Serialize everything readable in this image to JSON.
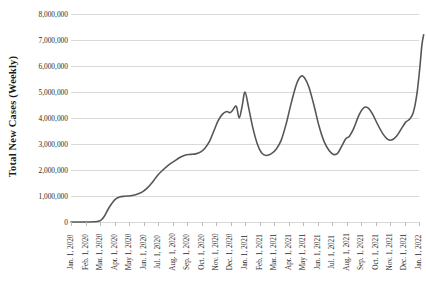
{
  "chart_data": {
    "type": "line",
    "title": "",
    "xlabel": "",
    "ylabel": "Total New Cases (Weekly)",
    "ylim": [
      0,
      8000000
    ],
    "y_ticks": [
      0,
      1000000,
      2000000,
      3000000,
      4000000,
      5000000,
      6000000,
      7000000,
      8000000
    ],
    "y_tick_labels": [
      "0",
      "1,000,000",
      "2,000,000",
      "3,000,000",
      "4,000,000",
      "5,000,000",
      "6,000,000",
      "7,000,000",
      "8,000,000"
    ],
    "grid": "horizontal",
    "legend": "none",
    "line_color": "#575757",
    "categories": [
      "Jan. 1, 2020",
      "Feb. 1, 2020",
      "Mar. 1, 2020",
      "Apr. 1, 2020",
      "May 1, 2020",
      "Jun. 1, 2020",
      "Jul. 1, 2020",
      "Aug. 1, 2020",
      "Sep. 1, 2020",
      "Oct. 1, 2020",
      "Nov. 1, 2020",
      "Dec. 1, 2020",
      "Jan. 1, 2021",
      "Feb. 1, 2021",
      "Mar. 1, 2021",
      "Apr. 1, 2021",
      "May 1, 2021",
      "Jun. 1, 2021",
      "Jul. 1, 2021",
      "Aug. 1, 2021",
      "Sep. 1, 2021",
      "Oct. 1, 2021",
      "Nov. 1, 2021",
      "Dec. 1, 2021",
      "Jan. 1, 2022"
    ],
    "series": [
      {
        "name": "Total New Cases (Weekly)",
        "values": [
          0,
          0,
          20000,
          600000,
          1000000,
          1080000,
          1250000,
          1800000,
          2100000,
          2350000,
          3200000,
          4000000,
          5000000,
          3000000,
          2600000,
          3300000,
          5600000,
          3700000,
          2600000,
          3900000,
          4400000,
          3400000,
          3150000,
          3900000,
          7200000
        ],
        "points": [
          {
            "x": 0.0,
            "y": 0
          },
          {
            "x": 0.3,
            "y": 0
          },
          {
            "x": 0.6,
            "y": 0
          },
          {
            "x": 0.9,
            "y": 0
          },
          {
            "x": 1.2,
            "y": 0
          },
          {
            "x": 1.5,
            "y": 8000
          },
          {
            "x": 1.8,
            "y": 20000
          },
          {
            "x": 2.05,
            "y": 60000
          },
          {
            "x": 2.3,
            "y": 220000
          },
          {
            "x": 2.55,
            "y": 480000
          },
          {
            "x": 2.8,
            "y": 700000
          },
          {
            "x": 3.05,
            "y": 870000
          },
          {
            "x": 3.35,
            "y": 960000
          },
          {
            "x": 3.7,
            "y": 990000
          },
          {
            "x": 4.1,
            "y": 1010000
          },
          {
            "x": 4.5,
            "y": 1060000
          },
          {
            "x": 4.9,
            "y": 1150000
          },
          {
            "x": 5.25,
            "y": 1300000
          },
          {
            "x": 5.6,
            "y": 1520000
          },
          {
            "x": 5.95,
            "y": 1780000
          },
          {
            "x": 6.3,
            "y": 1980000
          },
          {
            "x": 6.7,
            "y": 2180000
          },
          {
            "x": 7.1,
            "y": 2330000
          },
          {
            "x": 7.5,
            "y": 2480000
          },
          {
            "x": 7.9,
            "y": 2580000
          },
          {
            "x": 8.25,
            "y": 2600000
          },
          {
            "x": 8.6,
            "y": 2620000
          },
          {
            "x": 8.95,
            "y": 2700000
          },
          {
            "x": 9.25,
            "y": 2850000
          },
          {
            "x": 9.55,
            "y": 3100000
          },
          {
            "x": 9.85,
            "y": 3500000
          },
          {
            "x": 10.15,
            "y": 3900000
          },
          {
            "x": 10.45,
            "y": 4150000
          },
          {
            "x": 10.75,
            "y": 4250000
          },
          {
            "x": 10.95,
            "y": 4200000
          },
          {
            "x": 11.15,
            "y": 4300000
          },
          {
            "x": 11.4,
            "y": 4450000
          },
          {
            "x": 11.6,
            "y": 4000000
          },
          {
            "x": 11.8,
            "y": 4450000
          },
          {
            "x": 12.0,
            "y": 5000000
          },
          {
            "x": 12.25,
            "y": 4400000
          },
          {
            "x": 12.55,
            "y": 3600000
          },
          {
            "x": 12.85,
            "y": 3000000
          },
          {
            "x": 13.15,
            "y": 2650000
          },
          {
            "x": 13.45,
            "y": 2560000
          },
          {
            "x": 13.8,
            "y": 2620000
          },
          {
            "x": 14.15,
            "y": 2800000
          },
          {
            "x": 14.5,
            "y": 3150000
          },
          {
            "x": 14.85,
            "y": 3800000
          },
          {
            "x": 15.2,
            "y": 4600000
          },
          {
            "x": 15.55,
            "y": 5300000
          },
          {
            "x": 15.85,
            "y": 5600000
          },
          {
            "x": 16.1,
            "y": 5550000
          },
          {
            "x": 16.4,
            "y": 5200000
          },
          {
            "x": 16.75,
            "y": 4500000
          },
          {
            "x": 17.1,
            "y": 3700000
          },
          {
            "x": 17.45,
            "y": 3100000
          },
          {
            "x": 17.8,
            "y": 2750000
          },
          {
            "x": 18.1,
            "y": 2600000
          },
          {
            "x": 18.4,
            "y": 2650000
          },
          {
            "x": 18.7,
            "y": 2950000
          },
          {
            "x": 18.95,
            "y": 3200000
          },
          {
            "x": 19.2,
            "y": 3300000
          },
          {
            "x": 19.5,
            "y": 3600000
          },
          {
            "x": 19.85,
            "y": 4100000
          },
          {
            "x": 20.2,
            "y": 4400000
          },
          {
            "x": 20.5,
            "y": 4380000
          },
          {
            "x": 20.8,
            "y": 4150000
          },
          {
            "x": 21.15,
            "y": 3750000
          },
          {
            "x": 21.5,
            "y": 3400000
          },
          {
            "x": 21.8,
            "y": 3200000
          },
          {
            "x": 22.1,
            "y": 3150000
          },
          {
            "x": 22.45,
            "y": 3300000
          },
          {
            "x": 22.8,
            "y": 3600000
          },
          {
            "x": 23.1,
            "y": 3850000
          },
          {
            "x": 23.35,
            "y": 3950000
          },
          {
            "x": 23.6,
            "y": 4200000
          },
          {
            "x": 23.85,
            "y": 4900000
          },
          {
            "x": 24.05,
            "y": 5900000
          },
          {
            "x": 24.2,
            "y": 6800000
          },
          {
            "x": 24.32,
            "y": 7200000
          }
        ]
      }
    ]
  }
}
